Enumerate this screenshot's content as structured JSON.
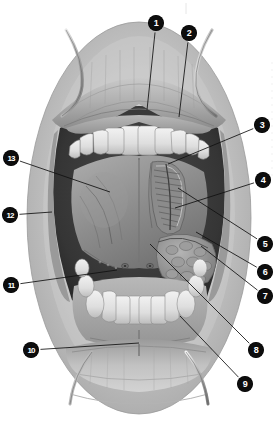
{
  "figure": {
    "style": "grayscale halftone medical illustration",
    "background_color": "#ffffff",
    "marker_fill": "#0d0d0d",
    "marker_text_color": "#ffffff",
    "leader_line_color": "#111111",
    "width": 279,
    "height": 424
  },
  "callouts": [
    {
      "id": 1,
      "label": "1",
      "mx": 156,
      "my": 23,
      "tx": 147,
      "ty": 110
    },
    {
      "id": 2,
      "label": "2",
      "mx": 189,
      "my": 33,
      "tx": 179,
      "ty": 117
    },
    {
      "id": 3,
      "label": "3",
      "mx": 262,
      "my": 125,
      "tx": 168,
      "ty": 164
    },
    {
      "id": 4,
      "label": "4",
      "mx": 263,
      "my": 180,
      "tx": 175,
      "ty": 208
    },
    {
      "id": 5,
      "label": "5",
      "mx": 265,
      "my": 244,
      "tx": 178,
      "ty": 188
    },
    {
      "id": 6,
      "label": "6",
      "mx": 265,
      "my": 272,
      "tx": 196,
      "ty": 232
    },
    {
      "id": 7,
      "label": "7",
      "mx": 265,
      "my": 296,
      "tx": 201,
      "ty": 246
    },
    {
      "id": 8,
      "label": "8",
      "mx": 256,
      "my": 350,
      "tx": 150,
      "ty": 244
    },
    {
      "id": 9,
      "label": "9",
      "mx": 245,
      "my": 384,
      "tx": 180,
      "ty": 316
    },
    {
      "id": 10,
      "label": "10",
      "mx": 31,
      "my": 350,
      "tx": 139,
      "ty": 343
    },
    {
      "id": 11,
      "label": "11",
      "mx": 11,
      "my": 285,
      "tx": 117,
      "ty": 270
    },
    {
      "id": 12,
      "label": "12",
      "mx": 10,
      "my": 215,
      "tx": 52,
      "ty": 212
    },
    {
      "id": 13,
      "label": "13",
      "mx": 11,
      "my": 158,
      "tx": 110,
      "ty": 192
    }
  ],
  "regions": [
    {
      "name": "upper-lip",
      "description": "everted upper lip held by retractor"
    },
    {
      "name": "upper-teeth-arch",
      "description": "maxillary incisors, canines and premolars"
    },
    {
      "name": "tongue-underside",
      "description": "inferior surface of tongue, ventral mucosa"
    },
    {
      "name": "lingual-frenulum",
      "description": "median fold beneath tongue"
    },
    {
      "name": "fimbriated-fold",
      "description": "fringed plica fimbriata with deep lingual vein"
    },
    {
      "name": "sublingual-caruncle",
      "description": "paired ducts openings at frenulum base"
    },
    {
      "name": "sublingual-fold",
      "description": "sublingual gland ridge on floor of mouth"
    },
    {
      "name": "lower-teeth-arch",
      "description": "mandibular incisors, canines and premolars"
    },
    {
      "name": "lower-gingiva",
      "description": "attached gingiva of mandible"
    },
    {
      "name": "lower-lip",
      "description": "everted lower lip held by retractor"
    },
    {
      "name": "labial-frenulum",
      "description": "median lower labial frenulum"
    },
    {
      "name": "retractor-left",
      "description": "metal lip retractor, left side"
    },
    {
      "name": "retractor-right",
      "description": "metal lip retractor, right side"
    },
    {
      "name": "cheek-mucosa",
      "description": "buccal mucosa lateral wall"
    }
  ]
}
